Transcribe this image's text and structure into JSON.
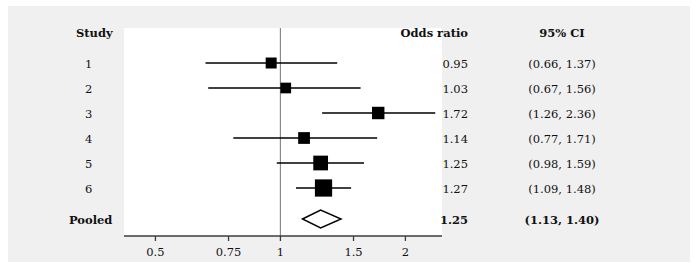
{
  "columns": {
    "study_header": "Study",
    "or_header": "Odds ratio",
    "ci_header": "95% CI"
  },
  "rows": [
    {
      "label": "1",
      "or": "0.95",
      "ci": "(0.66, 1.37)"
    },
    {
      "label": "2",
      "or": "1.03",
      "ci": "(0.67, 1.56)"
    },
    {
      "label": "3",
      "or": "1.72",
      "ci": "(1.26, 2.36)"
    },
    {
      "label": "4",
      "or": "1.14",
      "ci": "(0.77, 1.71)"
    },
    {
      "label": "5",
      "or": "1.25",
      "ci": "(0.98, 1.59)"
    },
    {
      "label": "6",
      "or": "1.27",
      "ci": "(1.09, 1.48)"
    },
    {
      "label": "Pooled",
      "or": "1.25",
      "ci": "(1.13, 1.40)"
    }
  ],
  "axis": {
    "ticks": [
      "0.5",
      "0.75",
      "1",
      "1.5",
      "2"
    ],
    "tick_values": [
      0.5,
      0.75,
      1,
      1.5,
      2
    ],
    "null_line": 1
  },
  "chart_data": {
    "type": "forest",
    "title": "",
    "xlabel": "",
    "ylabel": "",
    "scale": "log",
    "xlim": [
      0.42,
      2.45
    ],
    "grid": false,
    "legend": "none",
    "null_reference": 1,
    "xticks": [
      0.5,
      0.75,
      1,
      1.5,
      2
    ],
    "xticklabels": [
      "0.5",
      "0.75",
      "1",
      "1.5",
      "2"
    ],
    "categories": [
      "1",
      "2",
      "3",
      "4",
      "5",
      "6",
      "Pooled"
    ],
    "studies": [
      {
        "label": "1",
        "estimate": 0.95,
        "ci_low": 0.66,
        "ci_high": 1.37,
        "weight": 0.055,
        "marker": "square"
      },
      {
        "label": "2",
        "estimate": 1.03,
        "ci_low": 0.67,
        "ci_high": 1.56,
        "weight": 0.05,
        "marker": "square"
      },
      {
        "label": "3",
        "estimate": 1.72,
        "ci_low": 1.26,
        "ci_high": 2.36,
        "weight": 0.085,
        "marker": "square"
      },
      {
        "label": "4",
        "estimate": 1.14,
        "ci_low": 0.77,
        "ci_high": 1.71,
        "weight": 0.07,
        "marker": "square"
      },
      {
        "label": "5",
        "estimate": 1.25,
        "ci_low": 0.98,
        "ci_high": 1.59,
        "weight": 0.145,
        "marker": "square"
      },
      {
        "label": "6",
        "estimate": 1.27,
        "ci_low": 1.09,
        "ci_high": 1.48,
        "weight": 0.23,
        "marker": "square"
      },
      {
        "label": "Pooled",
        "estimate": 1.25,
        "ci_low": 1.13,
        "ci_high": 1.4,
        "weight": 1.0,
        "marker": "diamond"
      }
    ]
  },
  "style": {
    "marker_color": "#000000",
    "line_color": "#000000",
    "null_line_color": "#8a8a8a",
    "axis_color": "#3c3c3c",
    "panel_bg": "#ffffff",
    "figure_bg": "#f0f0f0",
    "text_color": "#111111"
  }
}
